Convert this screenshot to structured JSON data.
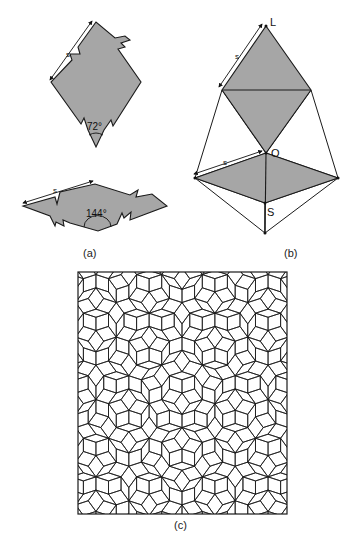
{
  "figure": {
    "panels": [
      {
        "id": "a",
        "label": "(a)",
        "description": "Penrose rhombi with matching-rule notched edges"
      },
      {
        "id": "b",
        "label": "(b)",
        "description": "Construction of rhombi with vertices L, O, S"
      },
      {
        "id": "c",
        "label": "(c)",
        "description": "Penrose rhombus tiling"
      }
    ],
    "panel_a": {
      "thin_rhombus": {
        "angle_label": "72°",
        "edge_label": "s"
      },
      "fat_rhombus": {
        "angle_label": "144°",
        "edge_label": "s"
      }
    },
    "panel_b": {
      "vertex_labels": {
        "top": "L",
        "middle": "O",
        "bottom": "S"
      },
      "edge_labels": [
        "s",
        "s"
      ]
    },
    "panel_c": {
      "tiling_note": "Tiling in (c) is a procedurally generated Penrose rhombus tiling (de Bruijn pentagrid method), not a cell-by-cell trace of the source image."
    },
    "colors": {
      "fill": "#a6a6a6",
      "stroke": "#1a1a1a",
      "background": "#ffffff"
    }
  },
  "chart_data": {
    "type": "diagram",
    "title": "",
    "panels": [
      "(a)",
      "(b)",
      "(c)"
    ],
    "annotations": [
      "s",
      "72°",
      "144°",
      "L",
      "O",
      "S"
    ],
    "tiling_is_generated": true
  }
}
